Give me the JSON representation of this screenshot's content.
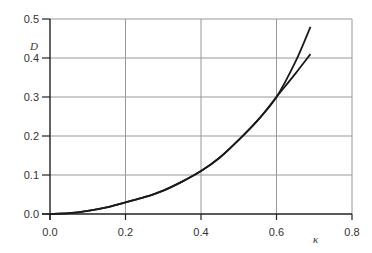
{
  "chart_data": {
    "type": "line",
    "title": "",
    "xlabel": "κ",
    "ylabel": "D",
    "xlim": [
      0.0,
      0.8
    ],
    "ylim": [
      0.0,
      0.5
    ],
    "grid": true,
    "legend": null,
    "x_ticks": [
      "0.0",
      "0.2",
      "0.4",
      "0.6",
      "0.8"
    ],
    "y_ticks": [
      "0.0",
      "0.1",
      "0.2",
      "0.3",
      "0.4",
      "0.5"
    ],
    "series": [
      {
        "name": "curve-upper",
        "x": [
          0.0,
          0.05,
          0.1,
          0.15,
          0.2,
          0.25,
          0.3,
          0.35,
          0.4,
          0.45,
          0.5,
          0.55,
          0.6,
          0.65,
          0.69
        ],
        "y": [
          0.0,
          0.002,
          0.008,
          0.017,
          0.03,
          0.043,
          0.06,
          0.083,
          0.11,
          0.145,
          0.19,
          0.24,
          0.3,
          0.39,
          0.48
        ]
      },
      {
        "name": "curve-lower",
        "x": [
          0.0,
          0.05,
          0.1,
          0.15,
          0.2,
          0.25,
          0.3,
          0.35,
          0.4,
          0.45,
          0.5,
          0.55,
          0.6,
          0.65,
          0.69
        ],
        "y": [
          0.0,
          0.002,
          0.008,
          0.017,
          0.03,
          0.043,
          0.06,
          0.083,
          0.11,
          0.145,
          0.19,
          0.24,
          0.3,
          0.36,
          0.41
        ]
      }
    ],
    "colors": {
      "line": "#1a1a1a",
      "grid": "#999999",
      "axis": "#222222"
    }
  },
  "axes": {
    "x_label": "κ",
    "y_label": "D"
  }
}
